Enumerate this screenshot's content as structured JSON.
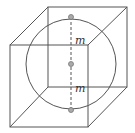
{
  "figure": {
    "labels": {
      "upper_radius": "m",
      "lower_radius": "m"
    },
    "colors": {
      "stroke": "#555555",
      "point_fill": "#aaaaaa"
    }
  }
}
